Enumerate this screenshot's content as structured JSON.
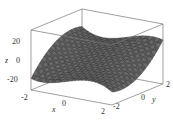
{
  "chart_data": {
    "type": "surface3d",
    "title": "",
    "xlabel": "x",
    "ylabel": "y",
    "zlabel": "z",
    "x_ticks": [
      "-2",
      "0",
      "2"
    ],
    "y_ticks": [
      "-2",
      "0",
      "2"
    ],
    "z_ticks": [
      "20",
      "0",
      "-20"
    ],
    "xlim": [
      -2,
      2
    ],
    "ylim": [
      -2,
      2
    ],
    "zlim": [
      -30,
      35
    ],
    "grid_resolution": 24,
    "surface_color": "#555555",
    "mesh_color": "#222222",
    "box_color": "#777777"
  }
}
